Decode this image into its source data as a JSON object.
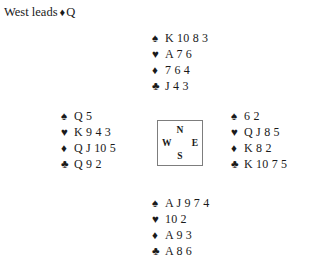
{
  "lead": {
    "text": "West leads",
    "suit_symbol": "♦",
    "suit_name": "diamond-icon",
    "card": "Q"
  },
  "compass": {
    "north": "N",
    "west": "W",
    "east": "E",
    "south": "S"
  },
  "colors": {
    "text": "#1a1a1a",
    "box_border": "#7d7d7d",
    "background": "#ffffff"
  },
  "suits": {
    "spade": "♠",
    "heart": "♥",
    "diamond": "♦",
    "club": "♣"
  },
  "hands": {
    "north": {
      "label": "North",
      "rows": [
        {
          "suit": "♠",
          "suit_name": "spade-icon",
          "cards": "K 10 8 3"
        },
        {
          "suit": "♥",
          "suit_name": "heart-icon",
          "cards": "A 7 6"
        },
        {
          "suit": "♦",
          "suit_name": "diamond-icon",
          "cards": "7 6 4"
        },
        {
          "suit": "♣",
          "suit_name": "club-icon",
          "cards": "J 4 3"
        }
      ]
    },
    "west": {
      "label": "West",
      "rows": [
        {
          "suit": "♠",
          "suit_name": "spade-icon",
          "cards": "Q 5"
        },
        {
          "suit": "♥",
          "suit_name": "heart-icon",
          "cards": "K 9 4 3"
        },
        {
          "suit": "♦",
          "suit_name": "diamond-icon",
          "cards": "Q J 10 5"
        },
        {
          "suit": "♣",
          "suit_name": "club-icon",
          "cards": "Q 9 2"
        }
      ]
    },
    "east": {
      "label": "East",
      "rows": [
        {
          "suit": "♠",
          "suit_name": "spade-icon",
          "cards": "6 2"
        },
        {
          "suit": "♥",
          "suit_name": "heart-icon",
          "cards": "Q J 8 5"
        },
        {
          "suit": "♦",
          "suit_name": "diamond-icon",
          "cards": "K 8 2"
        },
        {
          "suit": "♣",
          "suit_name": "club-icon",
          "cards": "K 10 7 5"
        }
      ]
    },
    "south": {
      "label": "South",
      "rows": [
        {
          "suit": "♠",
          "suit_name": "spade-icon",
          "cards": "A J 9 7 4"
        },
        {
          "suit": "♥",
          "suit_name": "heart-icon",
          "cards": "10 2"
        },
        {
          "suit": "♦",
          "suit_name": "diamond-icon",
          "cards": "A 9 3"
        },
        {
          "suit": "♣",
          "suit_name": "club-icon",
          "cards": "A 8 6"
        }
      ]
    }
  }
}
